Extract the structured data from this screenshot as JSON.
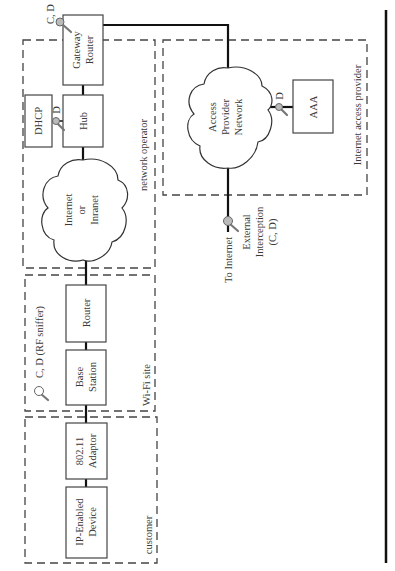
{
  "zones": {
    "network_operator": "network operator",
    "wifi_site": "Wi-Fi site",
    "customer": "customer",
    "internet_access_provider": "Internet access provider"
  },
  "nodes": {
    "gateway_router": [
      "Gateway",
      "Router"
    ],
    "dhcp": "DHCP",
    "hub": "Hub",
    "internet_cloud": [
      "Internet",
      "or",
      "Inranet"
    ],
    "router": "Router",
    "base_station": [
      "Base",
      "Station"
    ],
    "adaptor": [
      "802.11",
      "Adaptor"
    ],
    "device": [
      "IP-Enabled",
      "Device"
    ],
    "access_provider_cloud": [
      "Access",
      "Provider",
      "Network"
    ],
    "aaa": "AAA"
  },
  "interception_points": {
    "gateway": "C, D",
    "dhcp_hub": "D",
    "wifi": "C, D (RF sniffer)",
    "aaa": "D",
    "external": [
      "External",
      "Interception",
      "(C, D)"
    ]
  },
  "labels": {
    "to_internet": "To Internet"
  },
  "icons": {
    "interception": "magnifier-icon"
  }
}
